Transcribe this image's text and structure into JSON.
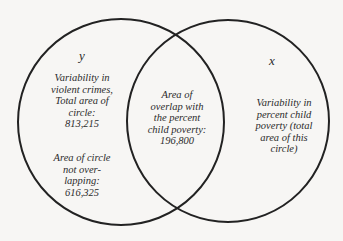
{
  "diagram": {
    "type": "venn",
    "circles": [
      {
        "id": "y",
        "label": "y",
        "cx": 121,
        "cy": 122,
        "r": 103
      },
      {
        "id": "x",
        "label": "x",
        "cx": 228,
        "cy": 121,
        "r": 101
      }
    ],
    "stroke_color": "#222222",
    "background": "#f7f6f4"
  },
  "labels": {
    "y_var": "y",
    "x_var": "x",
    "y_desc": [
      "Variability in",
      "violent crimes,",
      "Total area of",
      "circle:",
      "813,215"
    ],
    "y_nonoverlap": [
      "Area of circle",
      "not over-",
      "lapping:",
      "616,325"
    ],
    "overlap": [
      "Area of",
      "overlap with",
      "the percent",
      "child poverty:",
      "196,800"
    ],
    "x_desc": [
      "Variability in",
      "percent child",
      "poverty (total",
      "area of this",
      "circle)"
    ]
  }
}
